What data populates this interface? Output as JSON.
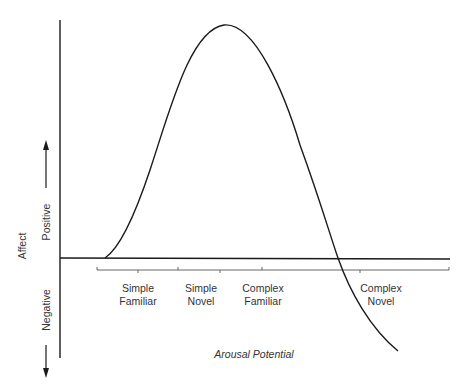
{
  "diagram": {
    "type": "inverted-U curve (Wundt curve)",
    "y_axis": {
      "label": "Affect",
      "positive_label": "Positive",
      "negative_label": "Negative"
    },
    "x_axis": {
      "label": "Arousal Potential"
    },
    "categories": [
      {
        "line1": "Simple",
        "line2": "Familiar"
      },
      {
        "line1": "Simple",
        "line2": "Novel"
      },
      {
        "line1": "Complex",
        "line2": "Familiar"
      },
      {
        "line1": "Complex",
        "line2": "Novel"
      }
    ],
    "colors": {
      "line": "#1a1a1a",
      "text": "#333333",
      "background": "#ffffff"
    }
  }
}
